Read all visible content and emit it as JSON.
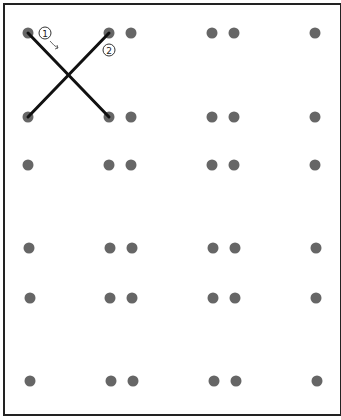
{
  "diagram": {
    "dot_color": "#666666",
    "line_color": "#111111",
    "dot_radius": 5.5,
    "rows_y": [
      33,
      117,
      165,
      248,
      298,
      381
    ],
    "cols_x": [
      28,
      109,
      131,
      212,
      234,
      315
    ],
    "rows": [
      {
        "y": 33,
        "dots_x": [
          28,
          109,
          131,
          212,
          234,
          315
        ]
      },
      {
        "y": 117,
        "dots_x": [
          28,
          109,
          131,
          212,
          234,
          315
        ]
      },
      {
        "y": 165,
        "dots_x": [
          28,
          109,
          131,
          212,
          234,
          315
        ]
      },
      {
        "y": 248,
        "dots_x": [
          29,
          110,
          132,
          213,
          235,
          316
        ]
      },
      {
        "y": 298,
        "dots_x": [
          30,
          110,
          132,
          213,
          235,
          316
        ]
      },
      {
        "y": 381,
        "dots_x": [
          30,
          111,
          133,
          214,
          236,
          317
        ]
      }
    ],
    "lines": [
      {
        "label": "1",
        "x1": 28,
        "y1": 33,
        "x2": 109,
        "y2": 117
      },
      {
        "label": "2",
        "x1": 28,
        "y1": 117,
        "x2": 109,
        "y2": 33
      }
    ],
    "annotations": [
      {
        "label": "1",
        "x": 45,
        "y": 33,
        "note": "circled number with arrow"
      },
      {
        "label": "2",
        "x": 109,
        "y": 50,
        "note": "circled number"
      }
    ]
  }
}
